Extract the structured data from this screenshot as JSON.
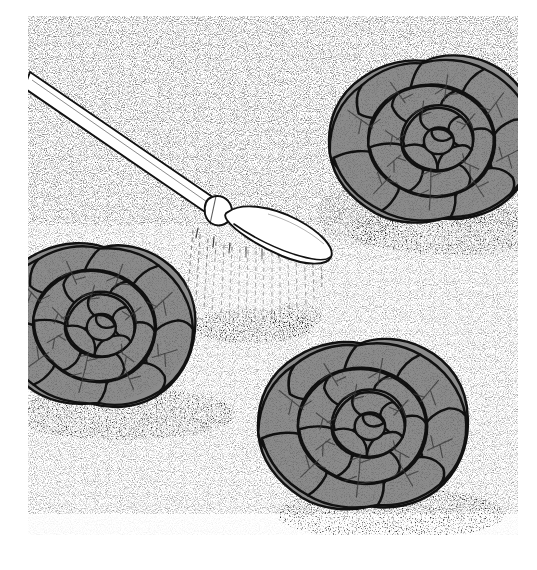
{
  "figure": {
    "medium": "stippled pen-and-ink line illustration",
    "palette": {
      "background": "#ffffff",
      "paper": "#ffffff",
      "leaf_fill": "#8b8b8b",
      "leaf_fill_shadow": "#7c7c7c",
      "outline": "#111111",
      "vein": "#3a3a3a",
      "stipple": "#2b2b2b",
      "wand_body": "#ffffff",
      "water": "#6b6b6b"
    },
    "plate": {
      "left": 28,
      "top": 16,
      "width": 490,
      "height": 519
    },
    "caption_artifact": ""
  },
  "scene": {
    "subject": "three head-lettuce plants in stippled garden soil being watered",
    "soil": {
      "name": "garden-soil",
      "texture": "stipple",
      "description": "fine dot stipple covering the whole ground plane, densest under the plants and where the water lands"
    },
    "wet_patch": {
      "name": "wet-soil-splash",
      "description": "dark dense stipple where the spray strikes the ground",
      "cx": 225,
      "cy": 310,
      "rx": 62,
      "ry": 17
    }
  },
  "watering_wand": {
    "name": "watering-wand",
    "parts": [
      {
        "name": "wand-tube",
        "label": "tube",
        "description": "long straight white tube entering from upper left"
      },
      {
        "name": "wand-collar",
        "label": "collar",
        "description": "short coupling ring joining tube to head"
      },
      {
        "name": "sprinkler-head",
        "label": "sprinkler head",
        "description": "elongated oval fan rose angled down-right"
      }
    ],
    "tube": {
      "x1": 8,
      "y1": 66,
      "x2": 186,
      "y2": 190,
      "half_width": 9
    },
    "collar": {
      "cx": 196,
      "cy": 197,
      "w": 22,
      "h": 19
    },
    "head": {
      "cx": 245,
      "cy": 222,
      "rx": 45,
      "ry": 17,
      "rotation_deg": 22
    }
  },
  "water_spray": {
    "name": "water-spray",
    "description": "vertical dashed streams falling from the sprinkler head to the soil",
    "stream_count": 17,
    "top_y": 234,
    "bottom_y": 312,
    "x_start": 192,
    "x_end": 280
  },
  "lettuce_heads": [
    {
      "id": "lettuce-left",
      "name": "lettuce-head-left",
      "label": "lettuce head (left)",
      "position": "left-center, clipped by the left border",
      "cx": 95,
      "cy": 325,
      "rx": 100,
      "ry": 82,
      "clipped_edge": "left"
    },
    {
      "id": "lettuce-top-right",
      "name": "lettuce-head-top-right",
      "label": "lettuce head (upper right)",
      "position": "upper right, clipped by the right border",
      "cx": 432,
      "cy": 140,
      "rx": 102,
      "ry": 82,
      "clipped_edge": "right"
    },
    {
      "id": "lettuce-bottom-right",
      "name": "lettuce-head-bottom-right",
      "label": "lettuce head (lower right)",
      "position": "lower right, fully visible rosette",
      "cx": 363,
      "cy": 425,
      "rx": 102,
      "ry": 82,
      "clipped_edge": "none"
    }
  ]
}
